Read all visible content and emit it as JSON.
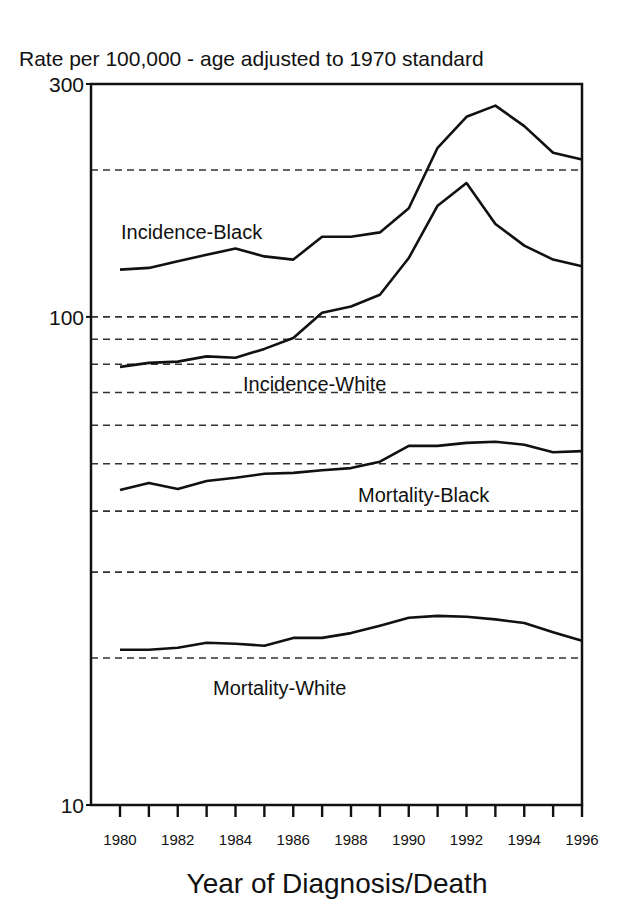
{
  "chart_data": {
    "type": "line",
    "title": "Rate per 100,000 - age adjusted to 1970 standard",
    "xlabel": "Year of Diagnosis/Death",
    "ylabel": "Rate per 100,000 - age adjusted to 1970 standard",
    "yscale": "log",
    "ylim": [
      10,
      300
    ],
    "xlim": [
      1980,
      1996
    ],
    "y_tick_labels": [
      "300",
      "100",
      "10"
    ],
    "y_ticks": [
      300,
      100,
      10
    ],
    "x_tick_labels": [
      "1980",
      "1982",
      "1984",
      "1986",
      "1988",
      "1990",
      "1992",
      "1994",
      "1996"
    ],
    "x_ticks_minor_every": 1,
    "gridlines_dashed": [
      200,
      100,
      90,
      80,
      70,
      60,
      50,
      40,
      30,
      20
    ],
    "legend": "none (inline labels)",
    "x": [
      1980,
      1981,
      1982,
      1983,
      1984,
      1985,
      1986,
      1987,
      1988,
      1989,
      1990,
      1991,
      1992,
      1993,
      1994,
      1995,
      1996
    ],
    "series": [
      {
        "name": "Incidence-Black",
        "label_pos": [
          121,
          239
        ],
        "values": [
          125,
          126,
          130,
          134,
          138,
          133,
          131,
          146,
          146,
          149,
          167,
          222,
          257,
          271,
          246,
          217,
          210
        ]
      },
      {
        "name": "Incidence-White",
        "label_pos": [
          243,
          391
        ],
        "values": [
          79,
          80.5,
          81,
          83,
          82.5,
          86,
          90.5,
          102,
          105,
          111,
          132,
          169,
          188,
          155,
          140,
          131,
          127
        ]
      },
      {
        "name": "Mortality-Black",
        "label_pos": [
          358,
          502
        ],
        "values": [
          44.2,
          45.7,
          44.4,
          46.1,
          46.8,
          47.7,
          47.9,
          48.5,
          49,
          50.5,
          54.4,
          54.4,
          55.2,
          55.5,
          54.7,
          52.8,
          53.1
        ]
      },
      {
        "name": "Mortality-White",
        "label_pos": [
          213,
          695
        ],
        "values": [
          20.8,
          20.8,
          21,
          21.5,
          21.4,
          21.2,
          22,
          22,
          22.5,
          23.3,
          24.2,
          24.4,
          24.3,
          24,
          23.6,
          22.6,
          21.7
        ]
      }
    ]
  },
  "colors": {
    "line": "#111111",
    "grid": "#333333",
    "background": "#ffffff"
  }
}
